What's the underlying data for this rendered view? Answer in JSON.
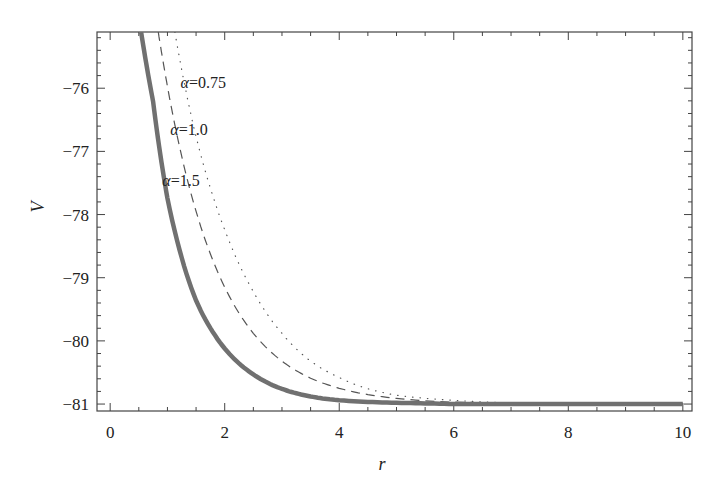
{
  "chart_data": {
    "type": "line",
    "title": "",
    "xlabel": "r",
    "ylabel": "V",
    "xlim": [
      -0.23,
      10.16
    ],
    "ylim": [
      -81.11,
      -75.11
    ],
    "x_ticks": [
      0,
      2,
      4,
      6,
      8,
      10
    ],
    "x_tick_labels": [
      "0",
      "2",
      "4",
      "6",
      "8",
      "10"
    ],
    "y_ticks": [
      -81,
      -80,
      -79,
      -78,
      -77,
      -76
    ],
    "y_tick_labels": [
      "−81",
      "−80",
      "−79",
      "−78",
      "−77",
      "−76"
    ],
    "grid": false,
    "legend": "inline annotations",
    "asymptote": -81,
    "series": [
      {
        "name": "α=0.75",
        "style": "dotted",
        "color": "#555555",
        "width": 1.2,
        "x": [
          1.13,
          1.5,
          2.0,
          2.5,
          3.0,
          3.5,
          4.0,
          5.0,
          6.0,
          7.0,
          8.0,
          9.0,
          10.0
        ],
        "y": [
          -75.11,
          -76.77,
          -78.24,
          -79.22,
          -79.88,
          -80.32,
          -80.58,
          -80.86,
          -80.94,
          -80.98,
          -80.99,
          -81.0,
          -81.0
        ]
      },
      {
        "name": "α=1.0",
        "style": "dashed",
        "color": "#555555",
        "width": 1.2,
        "x": [
          0.84,
          1.0,
          1.5,
          2.0,
          2.5,
          3.0,
          3.5,
          4.0,
          5.0,
          6.0,
          8.0,
          10.0
        ],
        "y": [
          -75.11,
          -75.97,
          -77.95,
          -79.15,
          -79.88,
          -80.32,
          -80.59,
          -80.75,
          -80.91,
          -80.97,
          -81.0,
          -81.0
        ]
      },
      {
        "name": "α=1.5",
        "style": "solid",
        "color": "#707070",
        "width": 4.5,
        "x": [
          0.54,
          0.75,
          1.0,
          1.5,
          2.0,
          2.5,
          3.0,
          3.5,
          4.0,
          5.0,
          6.0,
          8.0,
          10.0
        ],
        "y": [
          -75.11,
          -76.21,
          -77.74,
          -79.36,
          -80.12,
          -80.53,
          -80.76,
          -80.88,
          -80.94,
          -80.98,
          -81.0,
          -81.0,
          -81.0
        ]
      }
    ],
    "annotations": [
      {
        "text": "α=0.75",
        "x": 1.23,
        "y": -75.9
      },
      {
        "text": "α=1.0",
        "x": 1.05,
        "y": -76.65
      },
      {
        "text": "α=1.5",
        "x": 0.91,
        "y": -77.45
      }
    ]
  },
  "axes": {
    "xlabel": "r",
    "ylabel": "V"
  }
}
